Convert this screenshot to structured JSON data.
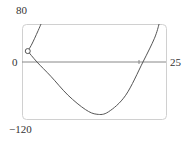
{
  "chart_data": {
    "type": "line",
    "title": "",
    "xlabel": "",
    "ylabel": "",
    "xlim": [
      0,
      25
    ],
    "ylim": [
      -120,
      80
    ],
    "grid": false,
    "tick_labels": {
      "y_top": "80",
      "y_zero": "0",
      "y_bottom": "−120",
      "x_right": "25"
    },
    "series": [
      {
        "name": "upper-branch",
        "x": [
          1.0,
          1.6,
          2.2,
          2.8,
          3.3
        ],
        "y": [
          23,
          35,
          50,
          66,
          80
        ]
      },
      {
        "name": "lower-branch",
        "x": [
          1.0,
          2.6,
          5,
          8,
          11,
          13,
          15,
          18,
          21,
          23,
          23.8
        ],
        "y": [
          23,
          0,
          -30,
          -70,
          -100,
          -110,
          -105,
          -70,
          0,
          50,
          80
        ]
      }
    ],
    "annotations": [
      {
        "type": "open-circle",
        "x": 1.0,
        "y": 23
      }
    ],
    "axis_tick": {
      "x": 20.5
    }
  },
  "colors": {
    "curve": "#555555",
    "axis": "#777777",
    "frame": "#cccccc"
  }
}
